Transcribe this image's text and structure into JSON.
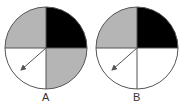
{
  "spinners": [
    {
      "label": "A",
      "quadrants": {
        "top_left": "#b5b5b5",
        "top_right": "#000000",
        "bottom_left": "#ffffff",
        "bottom_right": "#b5b5b5"
      },
      "arrow": "pointing to bottom-left quadrant"
    },
    {
      "label": "B",
      "quadrants": {
        "top_left": "#b5b5b5",
        "top_right": "#000000",
        "bottom_left": "#ffffff",
        "bottom_right": "#ffffff"
      },
      "arrow": "pointing to bottom-left quadrant"
    }
  ]
}
